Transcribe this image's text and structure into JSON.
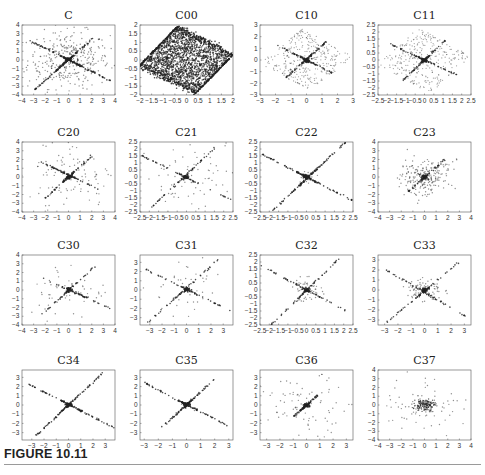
{
  "figure": {
    "label": "FIGURE 10.11"
  },
  "chart_data": [
    {
      "type": "scatter",
      "title": "C",
      "xlim": [
        -4,
        4
      ],
      "ylim": [
        -4,
        4
      ],
      "xticks": [
        "-4",
        "-3",
        "-2",
        "-1",
        "0",
        "1",
        "2",
        "3",
        "4"
      ],
      "yticks": [
        "-4",
        "-3",
        "-2",
        "-1",
        "0",
        "1",
        "2",
        "3",
        "4"
      ],
      "pattern": "two crossing dense lines (slopes ≈ +1.3 and ≈ -0.65) plus wide scatter",
      "lines": [
        {
          "from": [
            -2.9,
            -3.4
          ],
          "to": [
            2.1,
            2.5
          ]
        },
        {
          "from": [
            -3.3,
            2.2
          ],
          "to": [
            3.8,
            -2.5
          ]
        }
      ],
      "scatter_spread": 3.2,
      "scatter_count": 350,
      "line_points": 250
    },
    {
      "type": "scatter",
      "title": "C00",
      "xlim": [
        -2,
        2
      ],
      "ylim": [
        -2,
        2
      ],
      "xticks": [
        "-2",
        "-1.5",
        "-1",
        "-0.5",
        "0",
        "0.5",
        "1",
        "1.5",
        "2"
      ],
      "yticks": [
        "-2",
        "-1.5",
        "-1",
        "-0.5",
        "0",
        "0.5",
        "1",
        "1.5",
        "2"
      ],
      "pattern": "uniform filled parallelogram, corners ≈ (-0.5,2), (2,0.3), (0.5,-2), (-2,-0.3)",
      "corners": [
        [
          -0.4,
          1.9
        ],
        [
          2.0,
          0.3
        ],
        [
          0.4,
          -1.9
        ],
        [
          -2.0,
          -0.3
        ]
      ],
      "fill_count": 1800
    },
    {
      "type": "scatter",
      "title": "C10",
      "xlim": [
        -3,
        3
      ],
      "ylim": [
        -3,
        3
      ],
      "xticks": [
        "-3",
        "-2",
        "-1",
        "0",
        "1",
        "2",
        "3"
      ],
      "yticks": [
        "-3",
        "-2",
        "-1",
        "0",
        "1",
        "2",
        "3"
      ],
      "pattern": "two crossing lines inside a sparse diamond",
      "lines": [
        {
          "from": [
            -1.3,
            -1.5
          ],
          "to": [
            1.3,
            1.6
          ]
        },
        {
          "from": [
            -1.8,
            1.2
          ],
          "to": [
            1.8,
            -1.2
          ]
        }
      ],
      "corners": [
        [
          -0.3,
          2.7
        ],
        [
          3.0,
          0.3
        ],
        [
          0.3,
          -2.7
        ],
        [
          -3.0,
          -0.3
        ]
      ],
      "fill_count": 320,
      "line_points": 160
    },
    {
      "type": "scatter",
      "title": "C11",
      "xlim": [
        -2.5,
        2.5
      ],
      "ylim": [
        -2.5,
        2.5
      ],
      "xticks": [
        "-2.5",
        "-2",
        "-1.5",
        "-1",
        "-0.5",
        "0",
        "0.5",
        "1",
        "1.5",
        "2",
        "2.5"
      ],
      "yticks": [
        "-2.5",
        "-2",
        "-1.5",
        "-1",
        "-0.5",
        "0",
        "0.5",
        "1",
        "1.5",
        "2",
        "2.5"
      ],
      "pattern": "two crossing lines inside a sparse diamond",
      "lines": [
        {
          "from": [
            -1.2,
            -1.5
          ],
          "to": [
            1.2,
            1.5
          ]
        },
        {
          "from": [
            -1.8,
            1.1
          ],
          "to": [
            1.8,
            -1.1
          ]
        }
      ],
      "corners": [
        [
          -0.3,
          2.4
        ],
        [
          2.5,
          0.3
        ],
        [
          0.3,
          -2.4
        ],
        [
          -2.5,
          -0.3
        ]
      ],
      "fill_count": 300,
      "line_points": 150
    },
    {
      "type": "scatter",
      "title": "C20",
      "xlim": [
        -4,
        4
      ],
      "ylim": [
        -4,
        4
      ],
      "xticks": [
        "-4",
        "-3",
        "-2",
        "-1",
        "0",
        "1",
        "2",
        "3",
        "4"
      ],
      "yticks": [
        "-4",
        "-3",
        "-2",
        "-1",
        "0",
        "1",
        "2",
        "3",
        "4"
      ],
      "pattern": "two crossing lines with sparse ring scatter",
      "lines": [
        {
          "from": [
            -2.0,
            -2.4
          ],
          "to": [
            2.0,
            2.4
          ]
        },
        {
          "from": [
            -2.5,
            1.8
          ],
          "to": [
            2.6,
            -1.4
          ]
        }
      ],
      "scatter_spread": 3.5,
      "scatter_count": 110,
      "line_points": 140
    },
    {
      "type": "scatter",
      "title": "C21",
      "xlim": [
        -2.5,
        2.5
      ],
      "ylim": [
        -2.5,
        2.5
      ],
      "xticks": [
        "-2.5",
        "-2",
        "-1.5",
        "-1",
        "-0.5",
        "0",
        "0.5",
        "1",
        "1.5",
        "2",
        "2.5"
      ],
      "yticks": [
        "-2.5",
        "-2",
        "-1.5",
        "-1",
        "-0.5",
        "0",
        "0.5",
        "1",
        "1.5",
        "2",
        "2.5"
      ],
      "pattern": "two crossing lines, sparse points along them",
      "lines": [
        {
          "from": [
            -1.9,
            -2.2
          ],
          "to": [
            1.7,
            2.3
          ]
        },
        {
          "from": [
            -2.5,
            1.6
          ],
          "to": [
            2.5,
            -1.7
          ]
        }
      ],
      "scatter_spread": 2.0,
      "scatter_count": 70,
      "line_points": 120
    },
    {
      "type": "scatter",
      "title": "C22",
      "xlim": [
        -2.5,
        2.5
      ],
      "ylim": [
        -2.5,
        2.5
      ],
      "xticks": [
        "-2.5",
        "-2",
        "-1.5",
        "-1",
        "-0.5",
        "0",
        "0.5",
        "1",
        "1.5",
        "2",
        "2.5"
      ],
      "yticks": [
        "-2.5",
        "-2",
        "-1.5",
        "-1",
        "-0.5",
        "0",
        "0.5",
        "1",
        "1.5",
        "2",
        "2.5"
      ],
      "pattern": "two clean crossing lines spanning the full axes",
      "lines": [
        {
          "from": [
            -1.9,
            -2.5
          ],
          "to": [
            2.1,
            2.5
          ]
        },
        {
          "from": [
            -2.5,
            1.7
          ],
          "to": [
            2.5,
            -1.7
          ]
        }
      ],
      "scatter_spread": 0.4,
      "scatter_count": 25,
      "line_points": 220
    },
    {
      "type": "scatter",
      "title": "C23",
      "xlim": [
        -4,
        4
      ],
      "ylim": [
        -4,
        4
      ],
      "xticks": [
        "-4",
        "-3",
        "-2",
        "-1",
        "0",
        "1",
        "2",
        "3",
        "4"
      ],
      "yticks": [
        "-4",
        "-3",
        "-2",
        "-1",
        "0",
        "1",
        "2",
        "3",
        "4"
      ],
      "pattern": "dense center cluster with short diagonal arm and horizontal spread",
      "lines": [
        {
          "from": [
            -1.5,
            -1.8
          ],
          "to": [
            1.8,
            2.0
          ]
        }
      ],
      "scatter_spread": 2.0,
      "scatter_count": 220,
      "line_points": 60
    },
    {
      "type": "scatter",
      "title": "C30",
      "xlim": [
        -4,
        4
      ],
      "ylim": [
        -4,
        4
      ],
      "xticks": [
        "-4",
        "-3",
        "-2",
        "-1",
        "0",
        "1",
        "2",
        "3",
        "4"
      ],
      "yticks": [
        "-4",
        "-3",
        "-2",
        "-1",
        "0",
        "1",
        "2",
        "3",
        "4"
      ],
      "pattern": "sparse crossing lines with tight center",
      "lines": [
        {
          "from": [
            -2.7,
            -3.3
          ],
          "to": [
            2.5,
            3.0
          ]
        },
        {
          "from": [
            -2.2,
            1.3
          ],
          "to": [
            4.0,
            -2.3
          ]
        }
      ],
      "scatter_spread": 3.3,
      "scatter_count": 55,
      "line_points": 100
    },
    {
      "type": "scatter",
      "title": "C31",
      "xlim": [
        -3.8,
        3.8
      ],
      "ylim": [
        -3.8,
        3.8
      ],
      "xticks": [
        "-3",
        "-2",
        "-1",
        "0",
        "1",
        "2",
        "3"
      ],
      "yticks": [
        "-3",
        "-2",
        "-1",
        "0",
        "1",
        "2",
        "3"
      ],
      "pattern": "sparse crossing lines with tight center",
      "lines": [
        {
          "from": [
            -3.2,
            -3.6
          ],
          "to": [
            2.6,
            3.3
          ]
        },
        {
          "from": [
            -3.4,
            2.3
          ],
          "to": [
            3.8,
            -2.4
          ]
        }
      ],
      "scatter_spread": 3.0,
      "scatter_count": 45,
      "line_points": 110
    },
    {
      "type": "scatter",
      "title": "C32",
      "xlim": [
        -2.5,
        2.5
      ],
      "ylim": [
        -2.5,
        2.5
      ],
      "xticks": [
        "-2.5",
        "-2",
        "-1.5",
        "-1",
        "-0.5",
        "0",
        "0.5",
        "1",
        "1.5",
        "2",
        "2.5"
      ],
      "yticks": [
        "-2.5",
        "-2",
        "-1.5",
        "-1",
        "-0.5",
        "0",
        "0.5",
        "1",
        "1.5",
        "2",
        "2.5"
      ],
      "pattern": "crossing lines with dense center elongated along positive slope",
      "lines": [
        {
          "from": [
            -1.9,
            -2.5
          ],
          "to": [
            1.8,
            2.3
          ]
        },
        {
          "from": [
            -2.4,
            1.7
          ],
          "to": [
            2.3,
            -1.6
          ]
        }
      ],
      "scatter_spread": 0.8,
      "scatter_count": 60,
      "line_points": 120
    },
    {
      "type": "scatter",
      "title": "C33",
      "xlim": [
        -3.5,
        3.5
      ],
      "ylim": [
        -3.5,
        3.5
      ],
      "xticks": [
        "-3",
        "-2",
        "-1",
        "0",
        "1",
        "2",
        "3"
      ],
      "yticks": [
        "-3",
        "-2",
        "-1",
        "0",
        "1",
        "2",
        "3"
      ],
      "pattern": "crossing lines with dense center cluster",
      "lines": [
        {
          "from": [
            -2.8,
            -3.2
          ],
          "to": [
            2.8,
            3.0
          ]
        },
        {
          "from": [
            -3.0,
            2.1
          ],
          "to": [
            3.3,
            -2.8
          ]
        }
      ],
      "scatter_spread": 1.2,
      "scatter_count": 80,
      "line_points": 120
    },
    {
      "type": "scatter",
      "title": "C34",
      "xlim": [
        -3.8,
        3.8
      ],
      "ylim": [
        -3.8,
        3.8
      ],
      "xticks": [
        "-3",
        "-2",
        "-1",
        "0",
        "1",
        "2",
        "3"
      ],
      "yticks": [
        "-3",
        "-2",
        "-1",
        "0",
        "1",
        "2",
        "3"
      ],
      "pattern": "two very clean crossing lines",
      "lines": [
        {
          "from": [
            -2.8,
            -3.5
          ],
          "to": [
            2.8,
            3.5
          ]
        },
        {
          "from": [
            -3.3,
            2.3
          ],
          "to": [
            3.8,
            -2.5
          ]
        }
      ],
      "scatter_spread": 0.2,
      "scatter_count": 8,
      "line_points": 200
    },
    {
      "type": "scatter",
      "title": "C35",
      "xlim": [
        -3.3,
        3.3
      ],
      "ylim": [
        -3.8,
        3.8
      ],
      "xticks": [
        "-3",
        "-2",
        "-1",
        "0",
        "1",
        "2",
        "3"
      ],
      "yticks": [
        "-3",
        "-2",
        "-1",
        "0",
        "1",
        "2",
        "3"
      ],
      "pattern": "two clean crossing lines",
      "lines": [
        {
          "from": [
            -2.0,
            -2.8
          ],
          "to": [
            2.0,
            2.8
          ]
        },
        {
          "from": [
            -3.0,
            2.4
          ],
          "to": [
            3.0,
            -2.3
          ]
        }
      ],
      "scatter_spread": 0.4,
      "scatter_count": 18,
      "line_points": 180
    },
    {
      "type": "scatter",
      "title": "C36",
      "xlim": [
        -3.5,
        3.5
      ],
      "ylim": [
        -3.8,
        3.8
      ],
      "xticks": [
        "-3",
        "-2",
        "-1",
        "0",
        "1",
        "2",
        "3"
      ],
      "yticks": [
        "-3",
        "-2",
        "-1",
        "0",
        "1",
        "2",
        "3"
      ],
      "pattern": "dense center elongated diagonal, wide sparse scatter",
      "lines": [
        {
          "from": [
            -1.0,
            -1.3
          ],
          "to": [
            0.8,
            1.0
          ]
        }
      ],
      "scatter_spread": 3.0,
      "scatter_count": 85,
      "line_points": 90
    },
    {
      "type": "scatter",
      "title": "C37",
      "xlim": [
        -4,
        4
      ],
      "ylim": [
        -4,
        4
      ],
      "xticks": [
        "-4",
        "-3",
        "-2",
        "-1",
        "0",
        "1",
        "2",
        "3",
        "4"
      ],
      "yticks": [
        "-4",
        "-3",
        "-2",
        "-1",
        "0",
        "1",
        "2",
        "3",
        "4"
      ],
      "pattern": "dense central blob with sparse wide scatter",
      "lines": [],
      "scatter_spread": 3.2,
      "scatter_count": 75,
      "center_count": 140
    }
  ]
}
